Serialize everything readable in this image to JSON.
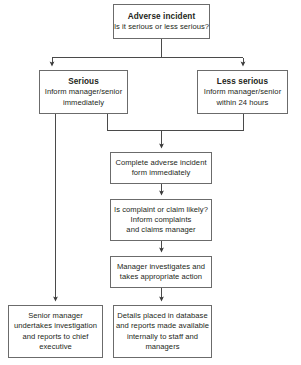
{
  "diagram": {
    "colors": {
      "box_border": "#6b6b6b",
      "connector": "#4a4a4a",
      "text": "#231f20",
      "background": "#ffffff"
    },
    "nodes": {
      "adverse_incident": {
        "title": "Adverse incident",
        "lines": [
          "Is it serious or less serious?"
        ]
      },
      "serious": {
        "title": "Serious",
        "lines": [
          "Inform manager/senior",
          "immediately"
        ]
      },
      "less_serious": {
        "title": "Less serious",
        "lines": [
          "Inform manager/senior",
          "within 24 hours"
        ]
      },
      "complete_form": {
        "title": "",
        "lines": [
          "Complete adverse incident",
          "form immediately"
        ]
      },
      "complaint_claim": {
        "title": "",
        "lines": [
          "Is complaint or claim likely?",
          "Inform complaints",
          "and claims manager"
        ]
      },
      "manager_investigates": {
        "title": "",
        "lines": [
          "Manager investigates and",
          "takes appropriate action"
        ]
      },
      "senior_manager": {
        "title": "",
        "lines": [
          "Senior manager",
          "undertakes investigation",
          "and reports to chief",
          "executive"
        ]
      },
      "details_database": {
        "title": "",
        "lines": [
          "Details placed in database",
          "and reports made available",
          "internally to staff and",
          "managers"
        ]
      }
    },
    "connectors": [
      {
        "name": "adverse-to-serious",
        "from": "adverse_incident",
        "to": "serious",
        "arrow": true
      },
      {
        "name": "adverse-to-less-serious",
        "from": "adverse_incident",
        "to": "less_serious",
        "arrow": true
      },
      {
        "name": "serious-to-complete-form",
        "from": "serious",
        "to": "complete_form",
        "arrow": true
      },
      {
        "name": "less-serious-to-complete-form",
        "from": "less_serious",
        "to": "complete_form",
        "arrow": true
      },
      {
        "name": "serious-to-senior-manager",
        "from": "serious",
        "to": "senior_manager",
        "arrow": true
      },
      {
        "name": "complete-form-to-complaint-claim",
        "from": "complete_form",
        "to": "complaint_claim",
        "arrow": true
      },
      {
        "name": "complaint-claim-to-manager-investigates",
        "from": "complaint_claim",
        "to": "manager_investigates",
        "arrow": true
      },
      {
        "name": "manager-investigates-to-details-database",
        "from": "manager_investigates",
        "to": "details_database",
        "arrow": true
      }
    ]
  }
}
